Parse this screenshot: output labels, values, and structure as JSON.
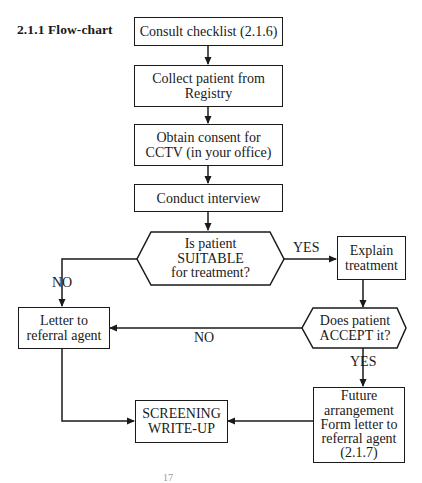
{
  "heading": "2.1.1  Flow-chart",
  "nodes": {
    "consult": {
      "lines": [
        "Consult checklist (2.1.6)"
      ]
    },
    "collect": {
      "lines": [
        "Collect patient from",
        "Registry"
      ]
    },
    "consent": {
      "lines": [
        "Obtain consent for",
        "CCTV (in your office)"
      ]
    },
    "interview": {
      "lines": [
        "Conduct interview"
      ]
    },
    "suitable": {
      "lines": [
        "Is patient",
        "SUITABLE",
        "for treatment?"
      ]
    },
    "explain": {
      "lines": [
        "Explain",
        "treatment"
      ]
    },
    "accept": {
      "lines": [
        "Does patient",
        "ACCEPT it?"
      ]
    },
    "letter": {
      "lines": [
        "Letter to",
        "referral agent"
      ]
    },
    "screening": {
      "lines": [
        "SCREENING",
        "WRITE-UP"
      ]
    },
    "future": {
      "lines": [
        "Future",
        "arrangement",
        "Form letter to",
        "referral agent",
        "(2.1.7)"
      ]
    }
  },
  "edge_labels": {
    "suitable_yes": "YES",
    "suitable_no": "NO",
    "accept_no": "NO",
    "accept_yes": "YES"
  },
  "page_number": "17"
}
